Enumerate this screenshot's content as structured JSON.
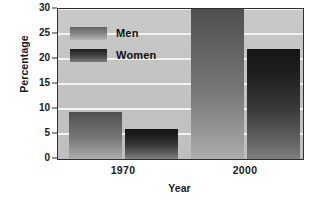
{
  "chart_data": {
    "type": "bar",
    "title": "",
    "subtitle": "",
    "xlabel": "Year",
    "ylabel": "Percentage",
    "categories": [
      "1970",
      "2000"
    ],
    "series": [
      {
        "name": "Men",
        "values": [
          9.5,
          30
        ]
      },
      {
        "name": "Women",
        "values": [
          6,
          22
        ]
      }
    ],
    "ylim": [
      0,
      30
    ],
    "yticks": [
      0,
      5,
      10,
      15,
      20,
      25,
      30
    ],
    "ytick_labels": [
      "0",
      "5",
      "10",
      "15",
      "20",
      "25",
      "30"
    ],
    "grid": "horizontal",
    "legend_position": "upper-left-inside",
    "annotations": [],
    "colors": {
      "men_bar_top": "#4f4f4f",
      "men_bar_bottom": "#aeaeae",
      "women_bar_top": "#151515",
      "women_bar_bottom": "#7e7e7e",
      "plot_background": "#c5c5c5",
      "gridline": "#f2f2f2",
      "axis": "#2f2f2f",
      "text": "#1a1a1a",
      "figure_background": "#ffffff"
    }
  },
  "legend": {
    "items": [
      {
        "label": "Men",
        "swatch": "men-swatch"
      },
      {
        "label": "Women",
        "swatch": "women-swatch"
      }
    ]
  }
}
